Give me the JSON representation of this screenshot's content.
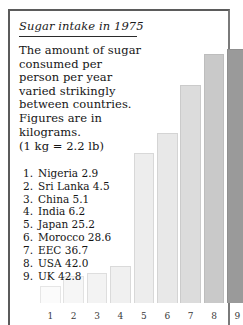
{
  "figure": {
    "title": "Sugar intake in 1975",
    "paragraph": "The amount of sugar consumed per person per year varied strikingly between countries. Figures are in kilograms.",
    "conversion_note": "(1 kg = 2.2 lb)",
    "list": [
      {
        "index": "1.",
        "label": "Nigeria 2.9"
      },
      {
        "index": "2.",
        "label": "Sri Lanka 4.5"
      },
      {
        "index": "3.",
        "label": "China 5.1"
      },
      {
        "index": "4.",
        "label": "India 6.2"
      },
      {
        "index": "5.",
        "label": "Japan 25.2"
      },
      {
        "index": "6.",
        "label": "Morocco 28.6"
      },
      {
        "index": "7.",
        "label": "EEC 36.7"
      },
      {
        "index": "8.",
        "label": "USA 42.0"
      },
      {
        "index": "9.",
        "label": "UK 42.8"
      }
    ]
  },
  "chart_data": {
    "type": "bar",
    "title": "Sugar intake in 1975",
    "xlabel": "",
    "ylabel": "Sugar consumed per person per year (kg)",
    "ylim": [
      0,
      42.8
    ],
    "grid": false,
    "legend": "none",
    "categories": [
      "1",
      "2",
      "3",
      "4",
      "5",
      "6",
      "7",
      "8",
      "9"
    ],
    "tick_labels": [
      "1",
      "2",
      "3",
      "4",
      "5",
      "6",
      "7",
      "8",
      "9"
    ],
    "country_names": [
      "Nigeria",
      "Sri Lanka",
      "China",
      "India",
      "Japan",
      "Morocco",
      "EEC",
      "USA",
      "UK"
    ],
    "values": [
      2.9,
      4.5,
      5.1,
      6.2,
      25.2,
      28.6,
      36.7,
      42.0,
      42.8
    ],
    "units": "kilograms",
    "bar_colors": [
      "#fbfbfb",
      "#f6f6f6",
      "#f3f3f3",
      "#f0f0f0",
      "#ededed",
      "#e8e8e8",
      "#dcdcdc",
      "#c9c9c9",
      "#9a9a9a"
    ],
    "bar_border_colors": [
      "#e6e6e6",
      "#e2e2e2",
      "#dedede",
      "#dadada",
      "#d8d8d8",
      "#d4d4d4",
      "#cbcbcb",
      "#bdbdbd",
      "#8f8f8f"
    ]
  },
  "style": {
    "frame_color": "#5b5b5b",
    "text_color": "#151515",
    "background": "#ffffff"
  }
}
